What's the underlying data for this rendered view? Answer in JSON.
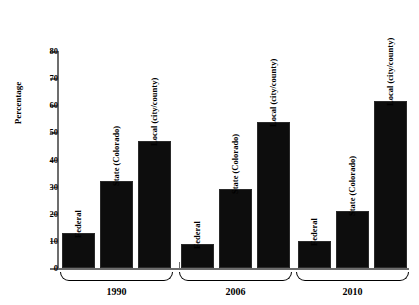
{
  "chart_data": {
    "type": "bar",
    "title": "",
    "xlabel": "",
    "ylabel": "Percentage",
    "ylim": [
      0,
      80
    ],
    "yticks": [
      0,
      10,
      20,
      30,
      40,
      50,
      60,
      70,
      80
    ],
    "grid": false,
    "legend": "none",
    "categories": [
      "1990",
      "2006",
      "2010"
    ],
    "series": [
      {
        "name": "Federal",
        "values": [
          13,
          9,
          10
        ]
      },
      {
        "name": "State (Colorado)",
        "values": [
          32,
          29,
          21
        ]
      },
      {
        "name": "Local (city/county)",
        "values": [
          47,
          54,
          61.5
        ]
      }
    ],
    "bar_color": "#0d0d0d",
    "axis_color": "#6d6d6d",
    "background": "#ffffff",
    "groups": [
      {
        "label": "1990",
        "bars": [
          {
            "label": "Federal",
            "value": 13
          },
          {
            "label": "State (Colorado)",
            "value": 32
          },
          {
            "label": "Local (city/county)",
            "value": 47
          }
        ]
      },
      {
        "label": "2006",
        "bars": [
          {
            "label": "Federal",
            "value": 9
          },
          {
            "label": "State (Colorado)",
            "value": 29
          },
          {
            "label": "Local (city/county)",
            "value": 54
          }
        ]
      },
      {
        "label": "2010",
        "bars": [
          {
            "label": "Federal",
            "value": 10
          },
          {
            "label": "State (Colorado)",
            "value": 21
          },
          {
            "label": "Local (city/county)",
            "value": 61.5
          }
        ]
      }
    ]
  }
}
